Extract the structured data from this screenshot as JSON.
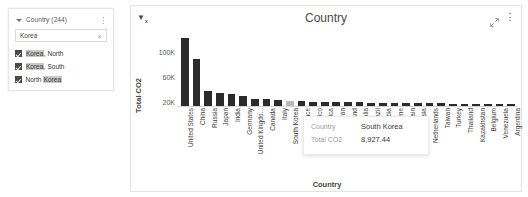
{
  "slicer": {
    "title": "Country (244)",
    "caret_icon": "caret-down-icon",
    "menu_icon": "more-options-icon",
    "search": {
      "value": "Korea",
      "placeholder": "Search",
      "clear_icon": "clear-icon",
      "clear_glyph": "×"
    },
    "items": [
      {
        "checked": true,
        "pre": "",
        "match": "Korea",
        "post": ", North"
      },
      {
        "checked": true,
        "pre": "",
        "match": "Korea",
        "post": ", South"
      },
      {
        "checked": true,
        "pre": "North ",
        "match": "Korea",
        "post": ""
      }
    ]
  },
  "chart_card": {
    "title": "Country",
    "filter_icon": "filter-applied-icon",
    "expand_icon": "focus-mode-icon",
    "more_icon": "more-options-icon"
  },
  "tooltip": {
    "rows": [
      {
        "key": "Country",
        "value": "South Korea"
      },
      {
        "key": "Total CO2",
        "value": "8,927.44"
      }
    ]
  },
  "chart_data": {
    "type": "bar",
    "title": "Country",
    "xlabel": "Country",
    "ylabel": "Total CO2",
    "ylim": [
      0,
      120000
    ],
    "yticks": [
      20000,
      60000,
      100000
    ],
    "ytick_labels": [
      "20K",
      "60K",
      "100K"
    ],
    "grid": false,
    "legend": null,
    "highlighted": "South Korea",
    "categories": [
      "United States",
      "China",
      "Russia",
      "Japan",
      "India",
      "Germany",
      "United Kingdo...",
      "Canada",
      "Italy",
      "South Korea",
      "France",
      "Mexico",
      "South Africa",
      "Iran",
      "Poland",
      "Australia",
      "Brazil",
      "Saudi Arabia",
      "Ukraine",
      "Spain",
      "Indonesia",
      "Netherlands",
      "Taiwan",
      "Turkey",
      "Thailand",
      "Kazakhstan",
      "Belgium",
      "Venezuela",
      "Argentina"
    ],
    "values": [
      112000,
      77000,
      25000,
      22000,
      19500,
      16500,
      12000,
      11000,
      10500,
      8927.44,
      8500,
      7200,
      6800,
      6400,
      6200,
      5900,
      5600,
      5300,
      5100,
      4900,
      4700,
      4500,
      4300,
      4100,
      3900,
      3700,
      3500,
      3300,
      3100
    ]
  }
}
